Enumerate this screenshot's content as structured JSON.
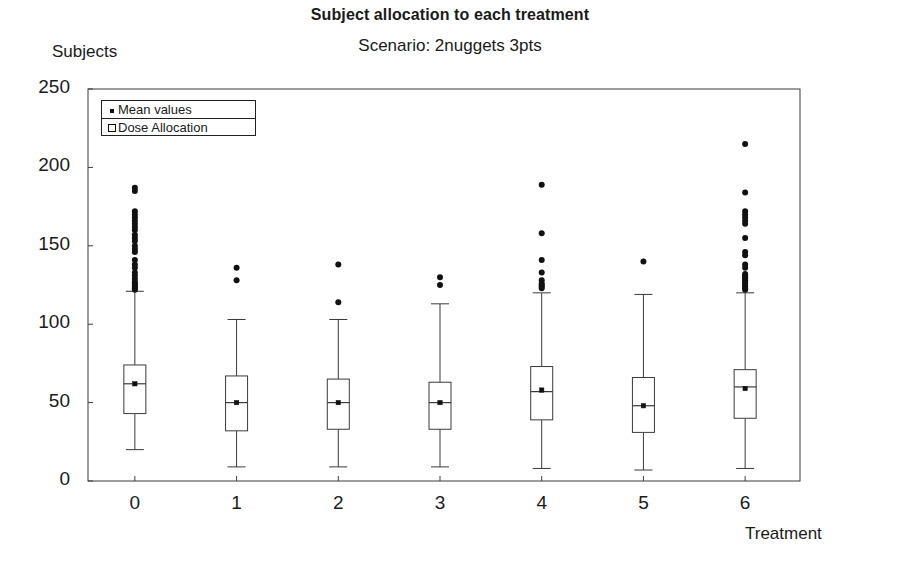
{
  "chart_data": {
    "type": "box",
    "title": "Subject allocation to each treatment",
    "subtitle": "Scenario: 2nuggets 3pts",
    "xlabel": "Treatment",
    "ylabel": "Subjects",
    "ylim": [
      0,
      250
    ],
    "yticks": [
      0,
      50,
      100,
      150,
      200,
      250
    ],
    "xticks": [
      "0",
      "1",
      "2",
      "3",
      "4",
      "5",
      "6"
    ],
    "grid": false,
    "legend": {
      "position": "top-left-inside",
      "entries": [
        {
          "label": "Mean values",
          "marker": "filled-square"
        },
        {
          "label": "Dose Allocation",
          "marker": "open-square"
        }
      ]
    },
    "categories": [
      "0",
      "1",
      "2",
      "3",
      "4",
      "5",
      "6"
    ],
    "boxes": [
      {
        "category": "0",
        "whisker_low": 20,
        "q1": 43,
        "median": 62,
        "mean": 62,
        "q3": 74,
        "whisker_high": 121,
        "outliers": [
          187,
          185,
          172,
          170,
          168,
          166,
          164,
          162,
          160,
          157,
          155,
          153,
          150,
          148,
          146,
          141,
          138,
          136,
          133,
          131,
          129,
          127,
          126,
          125,
          124,
          123,
          122
        ]
      },
      {
        "category": "1",
        "whisker_low": 9,
        "q1": 32,
        "median": 50,
        "mean": 50,
        "q3": 67,
        "whisker_high": 103,
        "outliers": [
          136,
          128
        ]
      },
      {
        "category": "2",
        "whisker_low": 9,
        "q1": 33,
        "median": 50,
        "mean": 50,
        "q3": 65,
        "whisker_high": 103,
        "outliers": [
          138,
          114
        ]
      },
      {
        "category": "3",
        "whisker_low": 9,
        "q1": 33,
        "median": 50,
        "mean": 50,
        "q3": 63,
        "whisker_high": 113,
        "outliers": [
          130,
          125
        ]
      },
      {
        "category": "4",
        "whisker_low": 8,
        "q1": 39,
        "median": 57,
        "mean": 58,
        "q3": 73,
        "whisker_high": 120,
        "outliers": [
          189,
          158,
          141,
          133,
          128,
          126,
          125,
          124,
          123
        ]
      },
      {
        "category": "5",
        "whisker_low": 7,
        "q1": 31,
        "median": 48,
        "mean": 48,
        "q3": 66,
        "whisker_high": 119,
        "outliers": [
          140
        ]
      },
      {
        "category": "6",
        "whisker_low": 8,
        "q1": 40,
        "median": 60,
        "mean": 59,
        "q3": 71,
        "whisker_high": 120,
        "outliers": [
          215,
          184,
          172,
          170,
          168,
          166,
          164,
          155,
          146,
          144,
          138,
          136,
          132,
          131,
          130,
          129,
          128,
          127,
          126,
          125,
          124,
          123,
          122
        ]
      }
    ]
  }
}
